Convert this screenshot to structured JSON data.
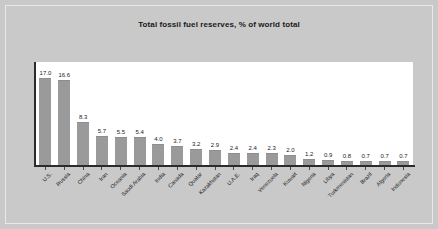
{
  "chart_data": {
    "type": "bar",
    "title": "Total fossil fuel reserves, % of world total",
    "xlabel": "",
    "ylabel": "",
    "ylim": [
      0,
      18.5
    ],
    "grid": false,
    "legend": "none",
    "categories": [
      "U.S.",
      "Russia",
      "China",
      "Iran",
      "Oceania",
      "Saudi Arabia",
      "India",
      "Canada",
      "Quatar",
      "Kazakhstan",
      "U.A.E.",
      "Iraq",
      "Venezuela",
      "Kuwait",
      "Nigeria",
      "Libya",
      "Turkmenistan",
      "Brazil",
      "Algeria",
      "Indonesia"
    ],
    "values": [
      17.0,
      16.6,
      8.3,
      5.7,
      5.5,
      5.4,
      4.0,
      3.7,
      3.2,
      2.9,
      2.4,
      2.4,
      2.3,
      2.0,
      1.2,
      0.9,
      0.8,
      0.7,
      0.7,
      0.7
    ],
    "value_labels": [
      "17.0",
      "16.6",
      "8.3",
      "5.7",
      "5.5",
      "5.4",
      "4.0",
      "3.7",
      "3.2",
      "2.9",
      "2.4",
      "2.4",
      "2.3",
      "2.0",
      "1.2",
      "0.9",
      "0.8",
      "0.7",
      "0.7",
      "0.7"
    ]
  },
  "colors": {
    "page_background": "#c9c9c9",
    "plot_background": "#ffffff",
    "bar_fill": "#9a9a9a",
    "axis_line": "#2b2b2b",
    "text": "#1a1a1a"
  }
}
